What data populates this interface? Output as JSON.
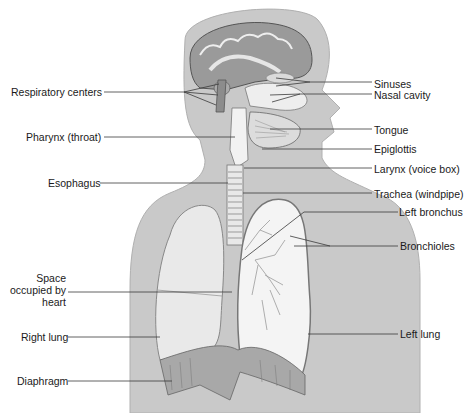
{
  "figure": {
    "type": "anatomical-diagram",
    "colors": {
      "body_fill": "#c8c8c8",
      "lung_fill": "#ebebeb",
      "outline": "#707070",
      "leader_line": "#3a3a3a",
      "text": "#1a1a1a"
    }
  },
  "labels_left": [
    {
      "id": "respiratory-centers",
      "text": "Respiratory centers"
    },
    {
      "id": "pharynx",
      "text": "Pharynx (throat)"
    },
    {
      "id": "esophagus",
      "text": "Esophagus"
    },
    {
      "id": "space-heart",
      "text": "Space occupied by heart"
    },
    {
      "id": "right-lung",
      "text": "Right lung"
    },
    {
      "id": "diaphragm",
      "text": "Diaphragm"
    }
  ],
  "labels_right": [
    {
      "id": "sinuses",
      "text": "Sinuses"
    },
    {
      "id": "nasal-cavity",
      "text": "Nasal cavity"
    },
    {
      "id": "tongue",
      "text": "Tongue"
    },
    {
      "id": "epiglottis",
      "text": "Epiglottis"
    },
    {
      "id": "larynx",
      "text": "Larynx (voice box)"
    },
    {
      "id": "trachea",
      "text": "Trachea (windpipe)"
    },
    {
      "id": "left-bronchus",
      "text": "Left bronchus"
    },
    {
      "id": "bronchioles",
      "text": "Bronchioles"
    },
    {
      "id": "left-lung",
      "text": "Left lung"
    }
  ]
}
